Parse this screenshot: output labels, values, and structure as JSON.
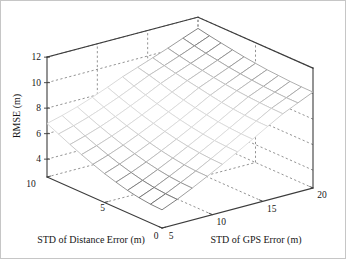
{
  "figure": {
    "background": "#ffffff",
    "border_color": "#c6c6c6",
    "axis_line_color": "#3c3c3c",
    "grid_line_color": "#777777",
    "mesh_face_color": "#ffffff"
  },
  "chart_data": {
    "type": "surface",
    "subtype": "3d-mesh-wireframe",
    "title": "",
    "xlabel": "STD of GPS Error (m)",
    "ylabel": "STD of Distance Error (m)",
    "zlabel": "RMSE (m)",
    "xlim": [
      5,
      20
    ],
    "ylim": [
      0,
      10
    ],
    "zlim": [
      2.6,
      12
    ],
    "x_ticks": [
      5,
      10,
      15,
      20
    ],
    "y_ticks": [
      0,
      5,
      10
    ],
    "z_ticks": [
      4,
      6,
      8,
      10,
      12
    ],
    "grid": true,
    "grid_style": "dashed",
    "colormap": "jet-printed-grayscale",
    "edge_shading": {
      "low_z": "#616161",
      "mid_z": "#d9d9d9",
      "high_z": "#6b6b6b"
    },
    "x_values": [
      5,
      6.5,
      8,
      9.5,
      11,
      12.5,
      14,
      15.5,
      17,
      18.5,
      20
    ],
    "y_values": [
      0,
      1,
      2,
      3,
      4,
      5,
      6,
      7,
      8,
      9,
      10
    ],
    "z_grid_rmse": [
      [
        4.03,
        4.07,
        4.18,
        4.35,
        4.59,
        4.87,
        5.2,
        5.56,
        5.95,
        6.37,
        6.8
      ],
      [
        4.53,
        4.57,
        4.66,
        4.82,
        5.04,
        5.3,
        5.6,
        5.94,
        6.31,
        6.7,
        7.11
      ],
      [
        5.1,
        5.13,
        5.22,
        5.36,
        5.55,
        5.79,
        6.07,
        6.38,
        6.72,
        7.09,
        7.48
      ],
      [
        5.71,
        5.73,
        5.81,
        5.94,
        6.11,
        6.33,
        6.59,
        6.87,
        7.19,
        7.54,
        7.91
      ],
      [
        6.34,
        6.37,
        6.44,
        6.55,
        6.71,
        6.91,
        7.15,
        7.41,
        7.71,
        8.03,
        8.38
      ],
      [
        7.0,
        7.03,
        7.09,
        7.19,
        7.34,
        7.52,
        7.74,
        7.98,
        8.26,
        8.56,
        8.89
      ],
      [
        7.68,
        7.7,
        7.76,
        7.85,
        7.99,
        8.15,
        8.35,
        8.58,
        8.84,
        9.1,
        9.32
      ],
      [
        8.37,
        8.39,
        8.44,
        8.53,
        8.65,
        8.81,
        8.99,
        9.16,
        9.34,
        9.53,
        9.75
      ],
      [
        9.05,
        9.07,
        9.11,
        9.17,
        9.25,
        9.35,
        9.49,
        9.64,
        9.8,
        9.99,
        10.19
      ],
      [
        9.59,
        9.59,
        9.63,
        9.68,
        9.77,
        9.86,
        9.98,
        10.13,
        10.28,
        10.46,
        10.66
      ],
      [
        10.12,
        10.13,
        10.16,
        10.22,
        10.28,
        10.38,
        10.49,
        10.63,
        10.78,
        10.94,
        11.12
      ]
    ]
  }
}
